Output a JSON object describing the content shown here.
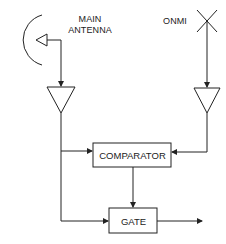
{
  "diagram": {
    "type": "block-diagram",
    "labels": {
      "main_antenna_line1": "MAIN",
      "main_antenna_line2": "ANTENNA",
      "omni": "ONMI"
    },
    "blocks": {
      "comparator": "COMPARATOR",
      "gate": "GATE"
    },
    "nodes": [
      {
        "id": "main-antenna",
        "kind": "dish-antenna",
        "label": "MAIN ANTENNA"
      },
      {
        "id": "omni-antenna",
        "kind": "omni-antenna",
        "label": "ONMI"
      },
      {
        "id": "main-amplifier",
        "kind": "amplifier"
      },
      {
        "id": "omni-amplifier",
        "kind": "amplifier"
      },
      {
        "id": "comparator",
        "kind": "block",
        "label": "COMPARATOR"
      },
      {
        "id": "gate",
        "kind": "block",
        "label": "GATE"
      }
    ],
    "edges": [
      {
        "from": "main-antenna",
        "to": "main-amplifier"
      },
      {
        "from": "omni-antenna",
        "to": "omni-amplifier"
      },
      {
        "from": "main-amplifier",
        "to": "comparator"
      },
      {
        "from": "omni-amplifier",
        "to": "comparator"
      },
      {
        "from": "main-amplifier",
        "to": "gate"
      },
      {
        "from": "comparator",
        "to": "gate"
      },
      {
        "from": "gate",
        "to": "output"
      }
    ],
    "colors": {
      "stroke": "#222222",
      "background": "#ffffff"
    }
  }
}
